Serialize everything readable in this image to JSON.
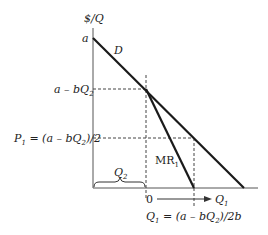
{
  "diagram": {
    "y_axis_label": "$/Q",
    "x_axis_label": "Q",
    "x_axis_label_sub": "1",
    "origin_label": "0",
    "intercept_label": "a",
    "demand_label": "D",
    "mr_label": "MR",
    "mr_label_sub": "1",
    "price_level_label": "a – bQ",
    "price_level_sub": "2",
    "optimal_price_label": "P",
    "optimal_price_sub": "1",
    "optimal_price_formula": "= (a – bQ",
    "optimal_price_formula_sub": "2",
    "optimal_price_formula_end": ")/2",
    "optimal_qty_label": "Q",
    "optimal_qty_sub": "1",
    "optimal_qty_formula": "= (a – bQ",
    "optimal_qty_formula_sub": "2",
    "optimal_qty_formula_end": ")/2b",
    "brace_label": "Q",
    "brace_label_sub": "2",
    "colors": {
      "line": "#1a1a1a",
      "dashed": "#444444",
      "text": "#222222"
    }
  }
}
